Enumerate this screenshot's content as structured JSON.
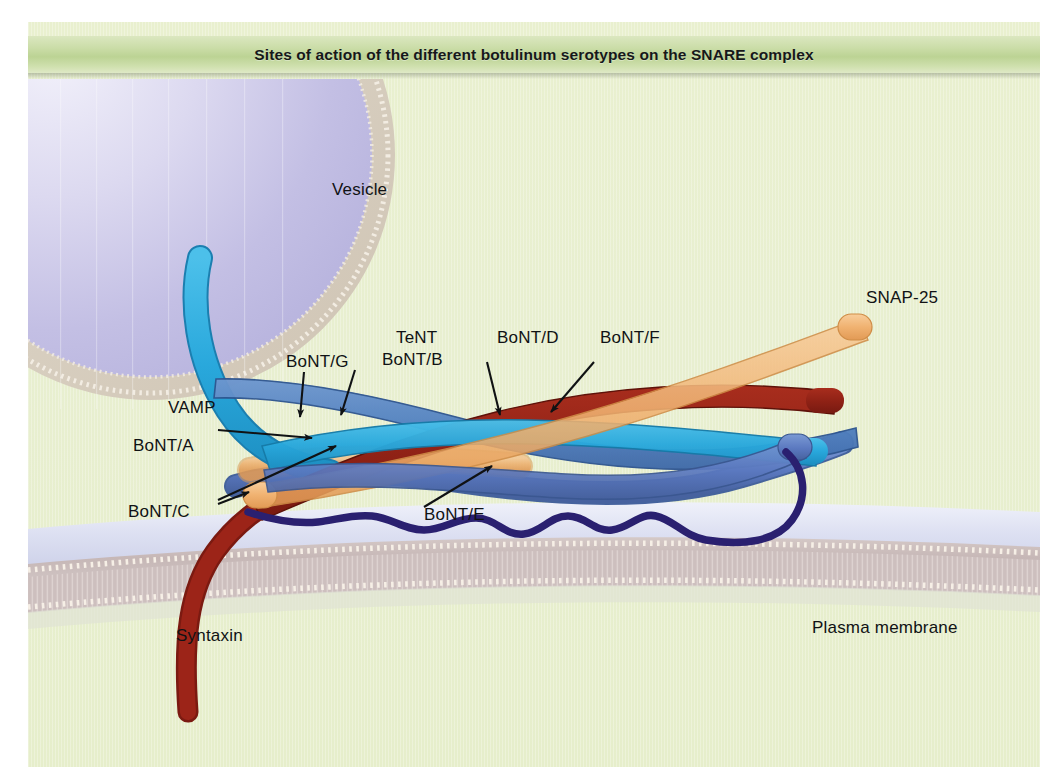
{
  "figure": {
    "title": "Sites of action of the different botulinum serotypes on the SNARE complex",
    "background_color": "#e8efd0",
    "title_band_color": "#c4d89e"
  },
  "structures": [
    {
      "id": "vesicle",
      "label": "Vesicle",
      "color": "#c9c7e8",
      "membrane_color": "#d8cfc0"
    },
    {
      "id": "plasma",
      "label": "Plasma membrane",
      "color": "#cfc3c4",
      "lumen_color": "#d9dcef"
    },
    {
      "id": "vamp",
      "label": "VAMP",
      "color": "#29a8dc"
    },
    {
      "id": "syntaxin",
      "label": "Syntaxin",
      "color": "#9c2418"
    },
    {
      "id": "snap25",
      "label": "SNAP-25",
      "color": "#f0b271"
    }
  ],
  "cleavage_sites": [
    {
      "id": "bont-g",
      "label": "BoNT/G",
      "target": "VAMP"
    },
    {
      "id": "tent-b",
      "label_line1": "TeNT",
      "label_line2": "BoNT/B",
      "target": "VAMP"
    },
    {
      "id": "bont-d",
      "label": "BoNT/D",
      "target": "VAMP"
    },
    {
      "id": "bont-f",
      "label": "BoNT/F",
      "target": "VAMP"
    },
    {
      "id": "bont-a",
      "label": "BoNT/A",
      "target": "SNAP-25"
    },
    {
      "id": "bont-c",
      "label": "BoNT/C",
      "target": "Syntaxin"
    },
    {
      "id": "bont-e",
      "label": "BoNT/E",
      "target": "SNAP-25"
    }
  ],
  "labels": {
    "vesicle": "Vesicle",
    "plasma_membrane": "Plasma membrane",
    "vamp": "VAMP",
    "syntaxin": "Syntaxin",
    "snap25": "SNAP-25",
    "bont_g": "BoNT/G",
    "tent": "TeNT",
    "bont_b": "BoNT/B",
    "bont_d": "BoNT/D",
    "bont_f": "BoNT/F",
    "bont_a": "BoNT/A",
    "bont_c": "BoNT/C",
    "bont_e": "BoNT/E"
  },
  "colors": {
    "vamp_light": "#29a8dc",
    "vamp_dark": "#4f7fc0",
    "syntaxin": "#9c2418",
    "snap25_orange": "#f0b271",
    "snap25_blue": "#4f6fc0",
    "linker": "#2a2070",
    "vesicle_fill": "#c9c7e8",
    "vesicle_membrane": "#d8cfc0",
    "membrane_head": "#cbbdbc",
    "membrane_lumen": "#d9dcef",
    "panel_bg": "#e8efd0",
    "title_band": "#c4d89e",
    "label_text": "#101214"
  }
}
